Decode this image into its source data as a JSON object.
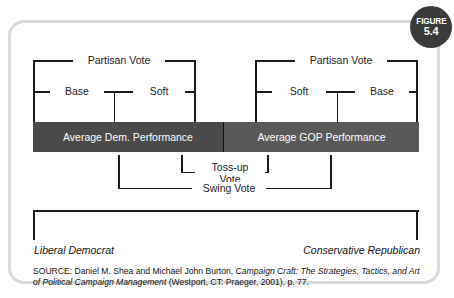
{
  "figure": {
    "badge_word": "FIGURE",
    "badge_number": "5.4"
  },
  "diagram": {
    "type": "bracket-diagram",
    "left_group": {
      "top_bracket_label": "Partisan Vote",
      "sub_left_label": "Base",
      "sub_right_label": "Soft",
      "bar_label": "Average Dem. Performance"
    },
    "right_group": {
      "top_bracket_label": "Partisan Vote",
      "sub_left_label": "Soft",
      "sub_right_label": "Base",
      "bar_label": "Average GOP Performance"
    },
    "tossup_label_line1": "Toss-up",
    "tossup_label_line2": "Vote",
    "swing_label": "Swing Vote",
    "axis_left_endpoint": "Liberal Democrat",
    "axis_right_endpoint": "Conservative Republican"
  },
  "source": {
    "prefix": "SOURCE: Daniel M. Shea and Michael John Burton, ",
    "title_part1": "Campaign Craft: The Strategies, Tactics, and Art of Political Campaign Management",
    "suffix": " (Westport, CT: Praeger, 2001), p. 77."
  },
  "colors": {
    "frame": "#d8d8d8",
    "badge": "#3b3b3b",
    "bar_dem": "#4a4a4a",
    "bar_gop": "#595959",
    "line": "#1b1b1b",
    "background": "#ffffff"
  }
}
